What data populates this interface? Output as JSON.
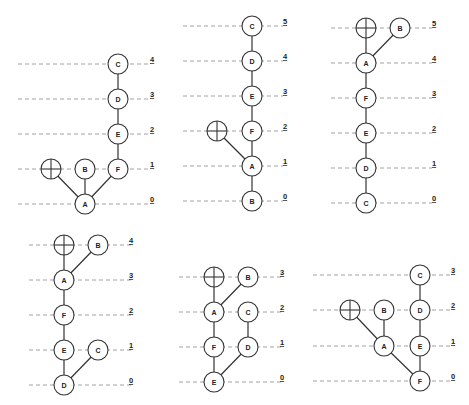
{
  "colors": {
    "line": "#8a8a8a",
    "stroke": "#333333",
    "text": "#222222",
    "background": "#ffffff"
  },
  "node_radius": 10,
  "panels": [
    {
      "id": "panel-1",
      "line_x": [
        18,
        148
      ],
      "label_x": 150,
      "levels": [
        {
          "label": "4",
          "y": 64
        },
        {
          "label": "3",
          "y": 99
        },
        {
          "label": "2",
          "y": 134
        },
        {
          "label": "1",
          "y": 169
        },
        {
          "label": "0",
          "y": 204
        }
      ],
      "nodes": [
        {
          "id": "root",
          "label": "",
          "type": "root",
          "x": 51,
          "y": 169
        },
        {
          "id": "B",
          "label": "B",
          "x": 85,
          "y": 169
        },
        {
          "id": "A",
          "label": "A",
          "x": 85,
          "y": 204
        },
        {
          "id": "F",
          "label": "F",
          "x": 118,
          "y": 169
        },
        {
          "id": "E",
          "label": "E",
          "x": 118,
          "y": 134
        },
        {
          "id": "D",
          "label": "D",
          "x": 118,
          "y": 99
        },
        {
          "id": "C",
          "label": "C",
          "x": 118,
          "y": 64
        }
      ],
      "edges": [
        [
          "root",
          "A"
        ],
        [
          "B",
          "A"
        ],
        [
          "F",
          "A"
        ],
        [
          "F",
          "E"
        ],
        [
          "E",
          "D"
        ],
        [
          "D",
          "C"
        ]
      ]
    },
    {
      "id": "panel-2",
      "line_x": [
        183,
        283
      ],
      "label_x": 283,
      "levels": [
        {
          "label": "5",
          "y": 26
        },
        {
          "label": "4",
          "y": 61
        },
        {
          "label": "3",
          "y": 96
        },
        {
          "label": "2",
          "y": 131
        },
        {
          "label": "1",
          "y": 166
        },
        {
          "label": "0",
          "y": 201
        }
      ],
      "nodes": [
        {
          "id": "C",
          "label": "C",
          "x": 252,
          "y": 26
        },
        {
          "id": "D",
          "label": "D",
          "x": 252,
          "y": 61
        },
        {
          "id": "E",
          "label": "E",
          "x": 252,
          "y": 96
        },
        {
          "id": "F",
          "label": "F",
          "x": 252,
          "y": 131
        },
        {
          "id": "root",
          "label": "",
          "type": "root",
          "x": 217,
          "y": 131
        },
        {
          "id": "A",
          "label": "A",
          "x": 252,
          "y": 166
        },
        {
          "id": "B",
          "label": "B",
          "x": 252,
          "y": 201
        }
      ],
      "edges": [
        [
          "C",
          "D"
        ],
        [
          "D",
          "E"
        ],
        [
          "E",
          "F"
        ],
        [
          "F",
          "A"
        ],
        [
          "root",
          "A"
        ],
        [
          "A",
          "B"
        ]
      ]
    },
    {
      "id": "panel-3",
      "line_x": [
        331,
        432
      ],
      "label_x": 432,
      "levels": [
        {
          "label": "5",
          "y": 28
        },
        {
          "label": "4",
          "y": 63
        },
        {
          "label": "3",
          "y": 98
        },
        {
          "label": "2",
          "y": 133
        },
        {
          "label": "1",
          "y": 168
        },
        {
          "label": "0",
          "y": 203
        }
      ],
      "nodes": [
        {
          "id": "root",
          "label": "",
          "type": "root",
          "x": 366,
          "y": 28
        },
        {
          "id": "B",
          "label": "B",
          "x": 400,
          "y": 28
        },
        {
          "id": "A",
          "label": "A",
          "x": 366,
          "y": 63
        },
        {
          "id": "F",
          "label": "F",
          "x": 366,
          "y": 98
        },
        {
          "id": "E",
          "label": "E",
          "x": 366,
          "y": 133
        },
        {
          "id": "D",
          "label": "D",
          "x": 366,
          "y": 168
        },
        {
          "id": "C",
          "label": "C",
          "x": 366,
          "y": 203
        }
      ],
      "edges": [
        [
          "root",
          "A"
        ],
        [
          "B",
          "A"
        ],
        [
          "A",
          "F"
        ],
        [
          "F",
          "E"
        ],
        [
          "E",
          "D"
        ],
        [
          "D",
          "C"
        ]
      ]
    },
    {
      "id": "panel-4",
      "line_x": [
        29,
        133
      ],
      "label_x": 129,
      "levels": [
        {
          "label": "4",
          "y": 245
        },
        {
          "label": "3",
          "y": 280
        },
        {
          "label": "2",
          "y": 315
        },
        {
          "label": "1",
          "y": 350
        },
        {
          "label": "0",
          "y": 385
        }
      ],
      "nodes": [
        {
          "id": "root",
          "label": "",
          "type": "root",
          "x": 64,
          "y": 245
        },
        {
          "id": "B",
          "label": "B",
          "x": 98,
          "y": 245
        },
        {
          "id": "A",
          "label": "A",
          "x": 64,
          "y": 280
        },
        {
          "id": "F",
          "label": "F",
          "x": 64,
          "y": 315
        },
        {
          "id": "E",
          "label": "E",
          "x": 64,
          "y": 350
        },
        {
          "id": "C",
          "label": "C",
          "x": 98,
          "y": 350
        },
        {
          "id": "D",
          "label": "D",
          "x": 64,
          "y": 385
        }
      ],
      "edges": [
        [
          "root",
          "A"
        ],
        [
          "B",
          "A"
        ],
        [
          "A",
          "F"
        ],
        [
          "F",
          "E"
        ],
        [
          "E",
          "D"
        ],
        [
          "C",
          "D"
        ]
      ]
    },
    {
      "id": "panel-5",
      "line_x": [
        179,
        283
      ],
      "label_x": 280,
      "levels": [
        {
          "label": "3",
          "y": 277
        },
        {
          "label": "2",
          "y": 312
        },
        {
          "label": "1",
          "y": 347
        },
        {
          "label": "0",
          "y": 382
        }
      ],
      "nodes": [
        {
          "id": "root",
          "label": "",
          "type": "root",
          "x": 214,
          "y": 277
        },
        {
          "id": "B",
          "label": "B",
          "x": 248,
          "y": 277
        },
        {
          "id": "A",
          "label": "A",
          "x": 214,
          "y": 312
        },
        {
          "id": "C",
          "label": "C",
          "x": 248,
          "y": 312
        },
        {
          "id": "F",
          "label": "F",
          "x": 214,
          "y": 347
        },
        {
          "id": "D",
          "label": "D",
          "x": 248,
          "y": 347
        },
        {
          "id": "E",
          "label": "E",
          "x": 214,
          "y": 382
        }
      ],
      "edges": [
        [
          "root",
          "A"
        ],
        [
          "B",
          "A"
        ],
        [
          "A",
          "F"
        ],
        [
          "C",
          "D"
        ],
        [
          "F",
          "E"
        ],
        [
          "D",
          "E"
        ]
      ]
    },
    {
      "id": "panel-6",
      "line_x": [
        313,
        452
      ],
      "label_x": 451,
      "levels": [
        {
          "label": "3",
          "y": 275
        },
        {
          "label": "2",
          "y": 310
        },
        {
          "label": "1",
          "y": 346
        },
        {
          "label": "0",
          "y": 381
        }
      ],
      "nodes": [
        {
          "id": "C",
          "label": "C",
          "x": 420,
          "y": 275
        },
        {
          "id": "root",
          "label": "",
          "type": "root",
          "x": 350,
          "y": 310
        },
        {
          "id": "B",
          "label": "B",
          "x": 384,
          "y": 310
        },
        {
          "id": "D",
          "label": "D",
          "x": 420,
          "y": 310
        },
        {
          "id": "A",
          "label": "A",
          "x": 384,
          "y": 346
        },
        {
          "id": "E",
          "label": "E",
          "x": 420,
          "y": 346
        },
        {
          "id": "F",
          "label": "F",
          "x": 420,
          "y": 381
        }
      ],
      "edges": [
        [
          "C",
          "D"
        ],
        [
          "D",
          "E"
        ],
        [
          "E",
          "F"
        ],
        [
          "root",
          "A"
        ],
        [
          "B",
          "A"
        ],
        [
          "A",
          "F"
        ]
      ]
    }
  ]
}
